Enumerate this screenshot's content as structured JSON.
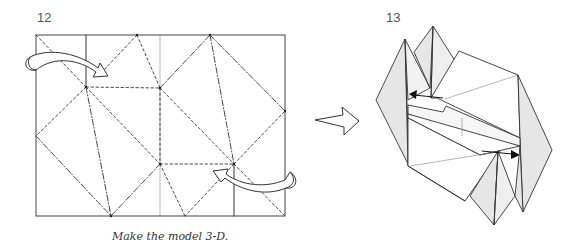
{
  "steps": [
    {
      "number": "12",
      "caption": "Make the model 3-D.",
      "diagram": "crease-pattern",
      "crease_types": [
        "valley-fold (dashed)",
        "mountain-fold (dash-dot)",
        "existing crease (solid)",
        "center line (gray)"
      ],
      "rotation_arrows": [
        "top-left curved arrow",
        "bottom-right curved arrow"
      ]
    },
    {
      "number": "13",
      "caption": "",
      "diagram": "3-D folded model",
      "push_arrows": [
        "upper arrow pointing left",
        "lower arrow pointing right"
      ]
    }
  ],
  "transition_arrow": "hollow right arrow",
  "colors": {
    "line": "#333333",
    "shade": "#e6e6e6",
    "center_line": "#bbbbbb",
    "paper": "#ffffff"
  }
}
